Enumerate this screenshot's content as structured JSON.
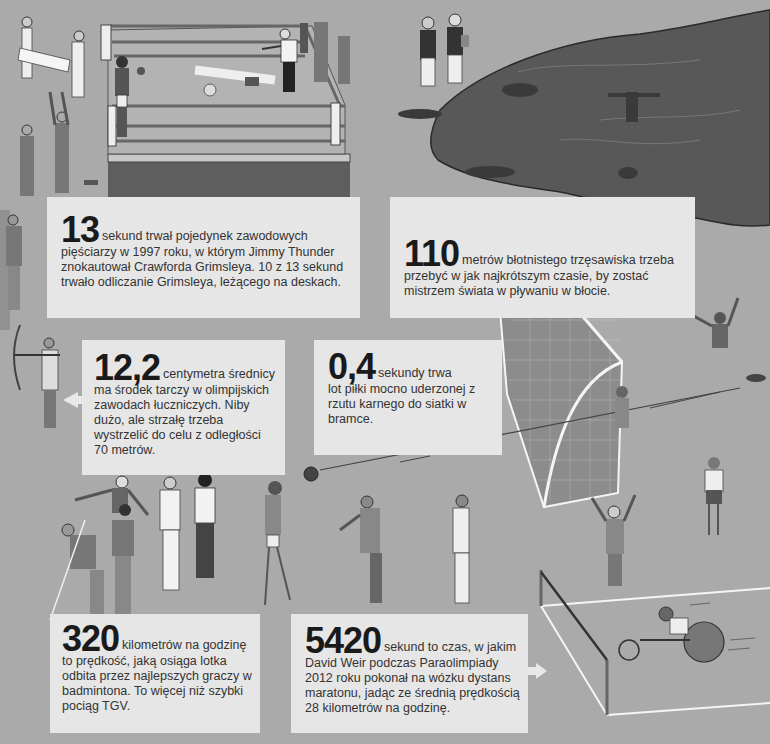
{
  "facts": {
    "boxing": {
      "number": "13",
      "lead": "sekund trwał pojedynek zawodowych",
      "body": "pięściarzy w 1997 roku, w którym Jimmy Thunder znokautował Crawforda Grimsleya. 10 z 13 sekund trwało odliczanie Grimsleya, leżącego na deskach."
    },
    "bog": {
      "number": "110",
      "lead": "metrów błotnistego trzęsawiska trzeba",
      "body": "przebyć w jak najkrótszym czasie, by zostać mistrzem świata w pływaniu w błocie."
    },
    "archery": {
      "number": "12,2",
      "lead": "centymetra średnicy",
      "body": "ma środek tarczy w olimpijskich zawodach łuczniczych. Niby dużo, ale strzałę trzeba wystrzelić do celu z odległości 70 metrów."
    },
    "penalty": {
      "number": "0,4",
      "lead": "sekundy trwa",
      "body": "lot piłki mocno uderzonej z rzutu karnego do siatki w bramce."
    },
    "badminton": {
      "number": "320",
      "lead": "kilometrów na godzinę",
      "body": "to prędkość, jaką osiąga lotka odbita przez najlepszych graczy w badmintona. To więcej niż szybki pociąg TGV."
    },
    "wheelchair": {
      "number": "5420",
      "lead": "sekund to czas, w jakim",
      "body": "David Weir podczas Paraolimpiady 2012 roku pokonał na wózku dystans maratonu, jadąc ze średnią prędkością 28 kilometrów na godzinę."
    }
  },
  "colors": {
    "background": "#aaaaaa",
    "box": "#e6e6e6",
    "mud": "#555555",
    "ring_apron": "#5e5e5e",
    "text": "#333333",
    "number": "#1a1a1a"
  }
}
